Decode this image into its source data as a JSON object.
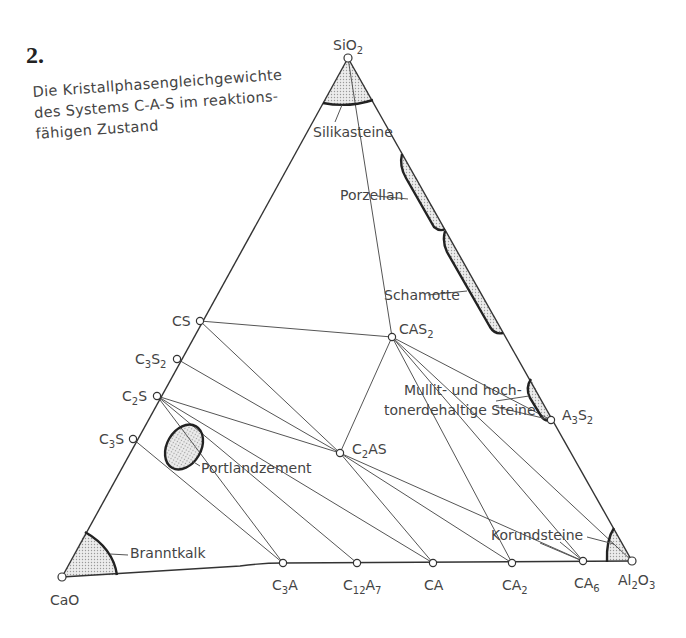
{
  "figure": {
    "number": "2.",
    "caption_lines": [
      "Die Kristallphasengleichgewichte",
      "des Systems C-A-S im reaktions-",
      "fähigen Zustand"
    ]
  },
  "vertices": {
    "top": {
      "label": "SiO",
      "sub": "2"
    },
    "left": {
      "label": "CaO"
    },
    "right": {
      "label": "Al",
      "sub1": "2",
      "mid": "O",
      "sub2": "3"
    }
  },
  "left_edge_phases": [
    {
      "id": "CS",
      "label": "CS"
    },
    {
      "id": "C3S2",
      "label": "C",
      "sub1": "3",
      "mid": "S",
      "sub2": "2"
    },
    {
      "id": "C2S",
      "label": "C",
      "sub1": "2",
      "mid": "S"
    },
    {
      "id": "C3S",
      "label": "C",
      "sub1": "3",
      "mid": "S"
    }
  ],
  "bottom_edge_phases": [
    {
      "id": "C3A",
      "label": "C",
      "sub1": "3",
      "mid": "A"
    },
    {
      "id": "C12A7",
      "label": "C",
      "sub1": "12",
      "mid": "A",
      "sub2": "7"
    },
    {
      "id": "CA",
      "label": "CA"
    },
    {
      "id": "CA2",
      "label": "CA",
      "sub1": "2"
    },
    {
      "id": "CA6",
      "label": "CA",
      "sub1": "6"
    }
  ],
  "right_edge_phases": [
    {
      "id": "A3S2",
      "label": "A",
      "sub1": "3",
      "mid": "S",
      "sub2": "2"
    }
  ],
  "ternary_phases": [
    {
      "id": "CAS2",
      "label": "CAS",
      "sub1": "2"
    },
    {
      "id": "C2AS",
      "label": "C",
      "sub1": "2",
      "mid": "AS"
    }
  ],
  "regions": {
    "silikasteine": "Silikasteine",
    "porzellan": "Porzellan",
    "schamotte": "Schamotte",
    "mullit_line1": "Mullit- und hoch-",
    "mullit_line2": "tonerdehaltige Steine",
    "portlandzement": "Portlandzement",
    "branntkalk": "Branntkalk",
    "korundsteine": "Korundsteine"
  },
  "colors": {
    "line": "#444444",
    "thick_line": "#222222",
    "fill": "#d8d8d8",
    "text": "#444444"
  }
}
